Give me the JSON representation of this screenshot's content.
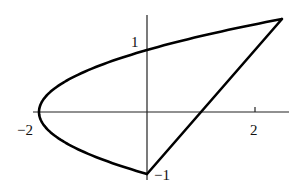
{
  "figure": {
    "curves": [
      {
        "name": "parabola",
        "equation": "x = 2y^2 - 2",
        "y_range": [
          -1,
          1.5
        ]
      },
      {
        "name": "line",
        "equation": "y = x - 1",
        "from": [
          0,
          -1
        ],
        "to": [
          2.5,
          1.5
        ]
      }
    ],
    "axes": {
      "x_labels": [
        {
          "value": -2,
          "text": "−2"
        },
        {
          "value": 2,
          "text": "2"
        }
      ],
      "y_labels": [
        {
          "value": 1,
          "text": "1"
        },
        {
          "value": -1,
          "text": "−1"
        }
      ]
    },
    "points": {
      "vertex": [
        -2,
        0
      ],
      "top_intersection": [
        2.5,
        1.5
      ],
      "bottom_intersection": [
        0,
        -1
      ],
      "y_intercept": [
        0,
        1
      ],
      "line_x_intercept": [
        1,
        0
      ]
    }
  },
  "labels": {
    "x_neg2": "−2",
    "x_2": "2",
    "y_1": "1",
    "y_neg1": "−1"
  }
}
